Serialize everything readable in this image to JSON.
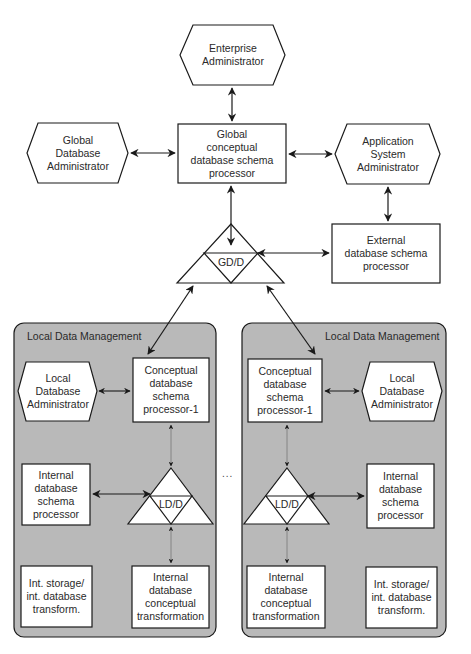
{
  "diagram": {
    "colors": {
      "panel_fill": "#b9b9b9",
      "node_fill": "#ffffff",
      "stroke": "#1a1a1a"
    },
    "global": {
      "enterprise_admin": "Enterprise\nAdministrator",
      "global_db_admin": "Global\nDatabase\nAdministrator",
      "global_schema_processor": "Global\nconceptual\ndatabase schema\nprocessor",
      "app_system_admin": "Application\nSystem\nAdministrator",
      "gdd": "GD/D",
      "external_schema_processor": "External\ndatabase schema\nprocessor"
    },
    "ellipsis": "...",
    "local_panels": [
      {
        "title": "Local Data Management",
        "local_db_admin": "Local\nDatabase\nAdministrator",
        "conceptual_processor": "Conceptual\ndatabase\nschema\nprocessor-1",
        "ldd": "LD/D",
        "internal_schema_processor": "Internal\ndatabase\nschema\nprocessor",
        "int_storage": "Int. storage/\nint. database\ntransform.",
        "internal_conceptual_transformation": "Internal\ndatabase\nconceptual\ntransformation"
      },
      {
        "title": "Local Data Management",
        "local_db_admin": "Local\nDatabase\nAdministrator",
        "conceptual_processor": "Conceptual\ndatabase\nschema\nprocessor-1",
        "ldd": "LD/D",
        "internal_schema_processor": "Internal\ndatabase\nschema\nprocessor",
        "int_storage": "Int. storage/\nint. database\ntransform.",
        "internal_conceptual_transformation": "Internal\ndatabase\nconceptual\ntransformation"
      }
    ]
  }
}
